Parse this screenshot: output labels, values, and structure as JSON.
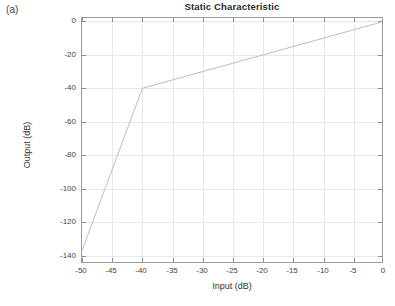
{
  "panel": {
    "label": "(a)"
  },
  "axis_label_x": "Input (dB)",
  "axis_label_y": "Output (dB)",
  "colors": {
    "line": "#b6b6b6",
    "axis": "#9a9a9a",
    "grid": "#e8e8e8",
    "text": "#3a3a3a",
    "background": "#ffffff"
  },
  "chart_data": {
    "type": "line",
    "title": "Static Characteristic",
    "xlabel": "Input (dB)",
    "ylabel": "Output (dB)",
    "xlim": [
      -50,
      0
    ],
    "ylim": [
      -145,
      2
    ],
    "xticks": [
      -50,
      -45,
      -40,
      -35,
      -30,
      -25,
      -20,
      -15,
      -10,
      -5,
      0
    ],
    "xticklabels": [
      "-50",
      "-45",
      "-40",
      "-35",
      "-30",
      "-25",
      "-20",
      "-15",
      "-10",
      "-5",
      "0"
    ],
    "yticks": [
      0,
      -20,
      -40,
      -60,
      -80,
      -100,
      -120,
      -140
    ],
    "yticklabels": [
      "0",
      "-20",
      "-40",
      "-60",
      "-80",
      "-100",
      "-120",
      "-140"
    ],
    "grid": true,
    "legend": null,
    "series": [
      {
        "name": "static characteristic",
        "x": [
          -50,
          -40,
          0
        ],
        "y": [
          -137,
          -40,
          0
        ]
      }
    ],
    "annotations": [
      {
        "text": "knee",
        "x": -40,
        "y": -40
      }
    ]
  }
}
